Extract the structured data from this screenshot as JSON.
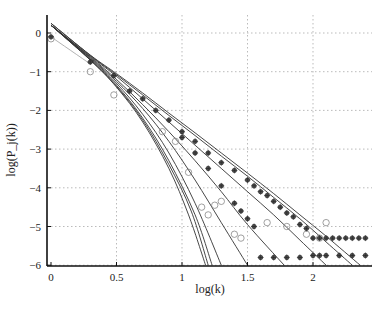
{
  "chart_data": {
    "type": "line",
    "title": "",
    "xlabel": "log(k)",
    "ylabel": "log(P_j(k))",
    "xlim": [
      0,
      2.42
    ],
    "ylim": [
      -6.05,
      0.45
    ],
    "grid": true,
    "legend": null,
    "x_ticks": [
      "0",
      "0.5",
      "1",
      "1.5",
      "2"
    ],
    "y_ticks": [
      "0",
      "−1",
      "−2",
      "−3",
      "−4",
      "−5",
      "−6"
    ],
    "x_tick_values": [
      0,
      0.5,
      1,
      1.5,
      2
    ],
    "y_tick_values": [
      0,
      -1,
      -2,
      -3,
      -4,
      -5,
      -6
    ],
    "series": [
      {
        "name": "fit-1",
        "style": "line",
        "x": [
          0,
          0.3,
          0.5,
          0.7,
          0.9,
          1.05,
          1.18
        ],
        "y": [
          0.2,
          -0.7,
          -1.4,
          -2.3,
          -3.5,
          -4.7,
          -6.0
        ]
      },
      {
        "name": "fit-2",
        "style": "line",
        "x": [
          0,
          0.3,
          0.5,
          0.7,
          0.9,
          1.07,
          1.2
        ],
        "y": [
          0.2,
          -0.7,
          -1.38,
          -2.25,
          -3.4,
          -4.6,
          -6.0
        ]
      },
      {
        "name": "fit-3",
        "style": "line",
        "x": [
          0,
          0.3,
          0.5,
          0.7,
          0.9,
          1.1,
          1.23
        ],
        "y": [
          0.2,
          -0.68,
          -1.35,
          -2.2,
          -3.3,
          -4.7,
          -6.0
        ]
      },
      {
        "name": "fit-4",
        "style": "line",
        "x": [
          0,
          0.3,
          0.5,
          0.7,
          0.9,
          1.1,
          1.3
        ],
        "y": [
          0.2,
          -0.66,
          -1.3,
          -2.1,
          -3.1,
          -4.4,
          -6.0
        ]
      },
      {
        "name": "fit-5",
        "style": "line",
        "x": [
          0,
          0.3,
          0.5,
          0.7,
          0.9,
          1.1,
          1.3,
          1.5
        ],
        "y": [
          0.2,
          -0.64,
          -1.25,
          -1.95,
          -2.8,
          -3.8,
          -4.9,
          -6.0
        ]
      },
      {
        "name": "fit-6",
        "style": "line",
        "x": [
          0,
          0.3,
          0.5,
          0.7,
          0.9,
          1.1,
          1.3,
          1.5,
          1.78
        ],
        "y": [
          0.2,
          -0.62,
          -1.2,
          -1.85,
          -2.55,
          -3.3,
          -4.1,
          -4.95,
          -6.0
        ]
      },
      {
        "name": "fit-7",
        "style": "line",
        "x": [
          0,
          0.3,
          0.5,
          0.7,
          0.9,
          1.1,
          1.3,
          1.5,
          1.7,
          1.9,
          2.1
        ],
        "y": [
          0.2,
          -0.6,
          -1.12,
          -1.7,
          -2.3,
          -2.9,
          -3.5,
          -4.1,
          -4.7,
          -5.35,
          -6.0
        ]
      },
      {
        "name": "fit-8",
        "style": "line",
        "x": [
          0,
          0.3,
          0.5,
          0.7,
          0.9,
          1.1,
          1.3,
          1.5,
          1.7,
          1.9,
          2.1,
          2.3
        ],
        "y": [
          0.25,
          -0.58,
          -1.08,
          -1.6,
          -2.13,
          -2.65,
          -3.18,
          -3.7,
          -4.25,
          -4.8,
          -5.4,
          -6.0
        ]
      },
      {
        "name": "fit-9",
        "style": "line",
        "x": [
          0,
          0.3,
          0.5,
          0.7,
          0.9,
          1.1,
          1.3,
          1.5,
          1.7,
          1.9,
          2.1,
          2.36
        ],
        "y": [
          0.25,
          -0.57,
          -1.05,
          -1.55,
          -2.07,
          -2.58,
          -3.1,
          -3.62,
          -4.15,
          -4.7,
          -5.25,
          -6.0
        ]
      },
      {
        "name": "fit-gray",
        "style": "line-light",
        "x": [
          0,
          0.3
        ],
        "y": [
          -0.1,
          -0.8
        ]
      },
      {
        "name": "data-circles",
        "style": "marker-circle",
        "x": [
          0,
          0.3,
          0.48,
          0.85,
          0.95,
          1.05,
          1.15,
          1.2,
          1.25,
          1.3,
          1.4,
          1.45,
          1.65,
          1.8,
          1.95,
          2.05,
          2.1
        ],
        "y": [
          -0.15,
          -1.0,
          -1.6,
          -2.55,
          -2.8,
          -3.6,
          -4.5,
          -4.7,
          -4.45,
          -4.35,
          -5.2,
          -5.3,
          -4.9,
          -5.0,
          -5.2,
          -5.3,
          -4.9
        ]
      },
      {
        "name": "data-stars",
        "style": "marker-star",
        "x": [
          0,
          0.3,
          0.48,
          0.6,
          0.7,
          0.8,
          0.9,
          1.0,
          1.1,
          1.2,
          1.3,
          1.4,
          1.5,
          1.55,
          1.6,
          1.65,
          1.7,
          1.75,
          1.8,
          1.85,
          1.9,
          1.95,
          2.0,
          2.05,
          2.1,
          2.15,
          2.2,
          2.25,
          2.3,
          2.35,
          2.4
        ],
        "y": [
          -0.1,
          -0.75,
          -1.1,
          -1.5,
          -1.7,
          -2.0,
          -2.25,
          -2.55,
          -2.8,
          -3.1,
          -3.35,
          -3.55,
          -3.8,
          -3.95,
          -4.1,
          -4.2,
          -4.35,
          -4.5,
          -4.65,
          -4.75,
          -4.95,
          -5.05,
          -5.3,
          -5.3,
          -5.3,
          -5.3,
          -5.3,
          -5.3,
          -5.3,
          -5.3,
          -5.3
        ]
      },
      {
        "name": "data-stars-2",
        "style": "marker-star",
        "x": [
          1.0,
          1.1,
          1.2,
          1.3,
          1.4,
          1.45,
          1.5,
          1.55,
          1.6,
          1.7,
          1.8,
          1.9,
          2.0,
          2.05,
          2.1,
          2.2,
          2.3,
          2.4
        ],
        "y": [
          -2.7,
          -3.1,
          -3.5,
          -3.95,
          -4.4,
          -4.6,
          -4.8,
          -5.0,
          -5.8,
          -5.8,
          -5.8,
          -5.8,
          -5.75,
          -5.75,
          -5.75,
          -5.75,
          -5.75,
          -5.75
        ]
      }
    ]
  },
  "axes": {
    "xlabel_text": "log(k)",
    "ylabel_text": "log(P_j(k))"
  }
}
